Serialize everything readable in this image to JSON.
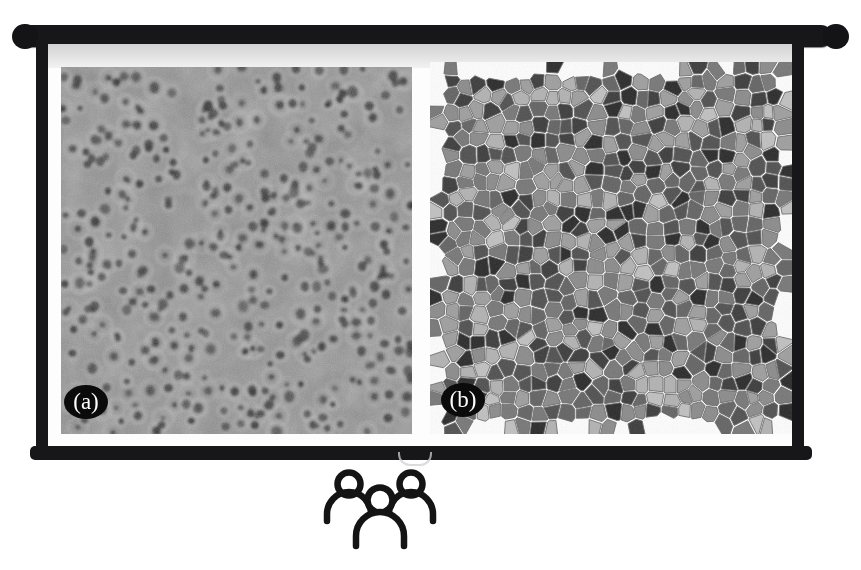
{
  "scene": {
    "type": "presentation-slide-on-projector-screen",
    "background_color": "#ffffff",
    "screen_frame_color": "#17171a",
    "screen_surface_color": "#fdfdfd"
  },
  "screen": {
    "roller_top_name": "top roller bar",
    "roller_bottom_name": "bottom weight bar",
    "handle_name": "pull handle",
    "band_name": "projection light band"
  },
  "slide": {
    "figure_caption": "",
    "panels": [
      {
        "id": "a",
        "label": "(a)",
        "badge_text": "(a)",
        "kind": "micrograph",
        "description": "grayscale electron micrograph showing dark nanopores on a mottled gray matrix",
        "base_color": "#909090",
        "pore_color": "#4a4a4a",
        "pore_count": 420
      },
      {
        "id": "b",
        "label": "(b)",
        "badge_text": "(b)",
        "kind": "voronoi-grain-map",
        "description": "Voronoi tessellation of grains rendered in discrete gray levels",
        "cell_edge_color": "#6a6a6a",
        "cell_count": 640,
        "gray_levels": [
          "#2a2a2a",
          "#3c3c3c",
          "#505050",
          "#636363",
          "#777777",
          "#8b8b8b",
          "#9e9e9e",
          "#b2b2b2",
          "#c0c0c0"
        ]
      }
    ]
  },
  "audience": {
    "icon_name": "three-people-icon",
    "person_count": 3,
    "stroke_color": "#141414"
  },
  "chart_data": {
    "type": "heatmap",
    "title": "",
    "xlabel": "",
    "ylabel": "",
    "panels": [
      {
        "name": "(a)",
        "type": "image",
        "content": "porous film micrograph",
        "value_range": [
          40,
          185
        ],
        "colormap": "gray"
      },
      {
        "name": "(b)",
        "type": "voronoi",
        "content": "grain orientation map",
        "value_range": [
          30,
          195
        ],
        "colormap": "gray"
      }
    ]
  }
}
